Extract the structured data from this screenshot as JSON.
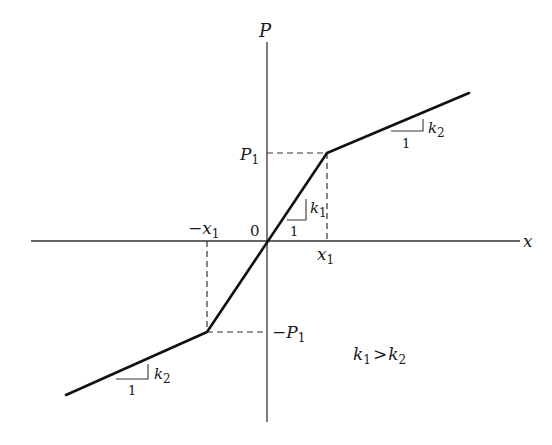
{
  "diagram": {
    "type": "piecewise-linear force-displacement curve (bilinear, symmetric)",
    "axes": {
      "x_label": "x",
      "y_label": "P",
      "origin_label": "0"
    },
    "points": {
      "x1_label_base": "x",
      "x1_label_sub": "1",
      "neg_x1_label_prefix": "−",
      "neg_x1_label_base": "x",
      "neg_x1_label_sub": "1",
      "p1_label_base": "P",
      "p1_label_sub": "1",
      "neg_p1_label_prefix": "−",
      "neg_p1_label_base": "P",
      "neg_p1_label_sub": "1"
    },
    "slopes": {
      "inner": {
        "run": "1",
        "rise_base": "k",
        "rise_sub": "1"
      },
      "outer_upper": {
        "run": "1",
        "rise_base": "k",
        "rise_sub": "2"
      },
      "outer_lower": {
        "run": "1",
        "rise_base": "k",
        "rise_sub": "2"
      }
    },
    "condition": {
      "left_base": "k",
      "left_sub": "1",
      "op": ">",
      "right_base": "k",
      "right_sub": "2"
    },
    "colors": {
      "ink": "#1a1a1a",
      "background": "#ffffff"
    }
  }
}
